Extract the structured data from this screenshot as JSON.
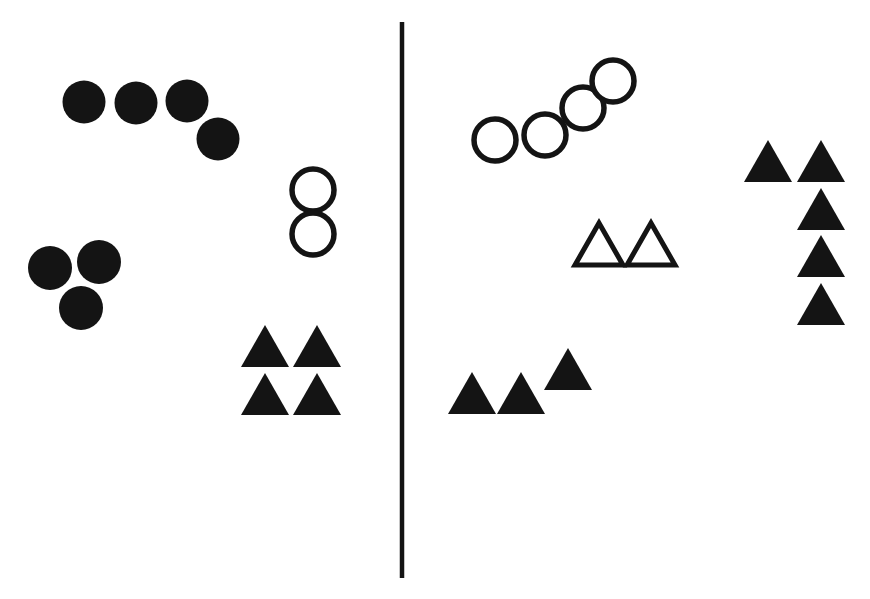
{
  "figure": {
    "title": "",
    "width": 870,
    "height": 599,
    "background_color": "#ffffff",
    "ink_color": "#141414"
  },
  "divider": {
    "name": "vertical-divider",
    "x": 402,
    "y_top": 22,
    "y_bottom": 578,
    "stroke_width": 4.5,
    "color": "#141414"
  },
  "chart_data": {
    "type": "scatter",
    "title": "",
    "xlabel": "",
    "ylabel": "",
    "xlim": [
      0,
      870
    ],
    "ylim": [
      0,
      599
    ],
    "grid": false,
    "legend": null,
    "panels": [
      {
        "id": "left-panel",
        "label": "Left panel",
        "groups": [
          {
            "id": "left-filled-circle-arc",
            "shape": "circle",
            "fill": "filled",
            "count": 4,
            "arrangement": "arc",
            "radius": 21.5,
            "points": [
              {
                "cx": 84,
                "cy": 102
              },
              {
                "cx": 136,
                "cy": 103
              },
              {
                "cx": 187,
                "cy": 101
              },
              {
                "cx": 218,
                "cy": 139
              }
            ]
          },
          {
            "id": "left-filled-circle-triad",
            "shape": "circle",
            "fill": "filled",
            "count": 3,
            "arrangement": "triangular-cluster",
            "radius": 22,
            "points": [
              {
                "cx": 50,
                "cy": 268
              },
              {
                "cx": 99,
                "cy": 262
              },
              {
                "cx": 81,
                "cy": 308
              }
            ]
          },
          {
            "id": "left-open-circle-pair",
            "shape": "circle",
            "fill": "open",
            "count": 2,
            "arrangement": "vertical-pair",
            "radius": 21,
            "points": [
              {
                "cx": 313,
                "cy": 190
              },
              {
                "cx": 313,
                "cy": 234
              }
            ]
          },
          {
            "id": "left-filled-triangle-grid",
            "shape": "triangle",
            "fill": "filled",
            "count": 4,
            "arrangement": "2x2-grid",
            "half_width": 24,
            "height": 42,
            "points": [
              {
                "cx": 265,
                "cy_base": 367
              },
              {
                "cx": 317,
                "cy_base": 367
              },
              {
                "cx": 265,
                "cy_base": 415
              },
              {
                "cx": 317,
                "cy_base": 415
              }
            ]
          }
        ]
      },
      {
        "id": "right-panel",
        "label": "Right panel",
        "groups": [
          {
            "id": "right-open-circle-arc",
            "shape": "circle",
            "fill": "open",
            "count": 4,
            "arrangement": "ascending-diagonal-arc",
            "radius": 21,
            "points": [
              {
                "cx": 495,
                "cy": 140
              },
              {
                "cx": 545,
                "cy": 135
              },
              {
                "cx": 583,
                "cy": 108
              },
              {
                "cx": 613,
                "cy": 81
              }
            ]
          },
          {
            "id": "right-open-triangle-pair",
            "shape": "triangle",
            "fill": "open",
            "count": 2,
            "arrangement": "horizontal-pair",
            "half_width": 24,
            "height": 42,
            "points": [
              {
                "cx": 599,
                "cy_base": 265
              },
              {
                "cx": 651,
                "cy_base": 265
              }
            ]
          },
          {
            "id": "right-filled-triangle-row",
            "shape": "triangle",
            "fill": "filled",
            "count": 3,
            "arrangement": "staggered-row",
            "half_width": 24,
            "height": 42,
            "points": [
              {
                "cx": 472,
                "cy_base": 414
              },
              {
                "cx": 521,
                "cy_base": 414
              },
              {
                "cx": 568,
                "cy_base": 390
              }
            ]
          },
          {
            "id": "right-filled-triangle-column",
            "shape": "triangle",
            "fill": "filled",
            "count": 5,
            "arrangement": "l-shaped-column",
            "half_width": 24,
            "height": 42,
            "points": [
              {
                "cx": 768,
                "cy_base": 182
              },
              {
                "cx": 821,
                "cy_base": 182
              },
              {
                "cx": 821,
                "cy_base": 230
              },
              {
                "cx": 821,
                "cy_base": 277
              },
              {
                "cx": 821,
                "cy_base": 325
              }
            ]
          }
        ]
      }
    ]
  }
}
